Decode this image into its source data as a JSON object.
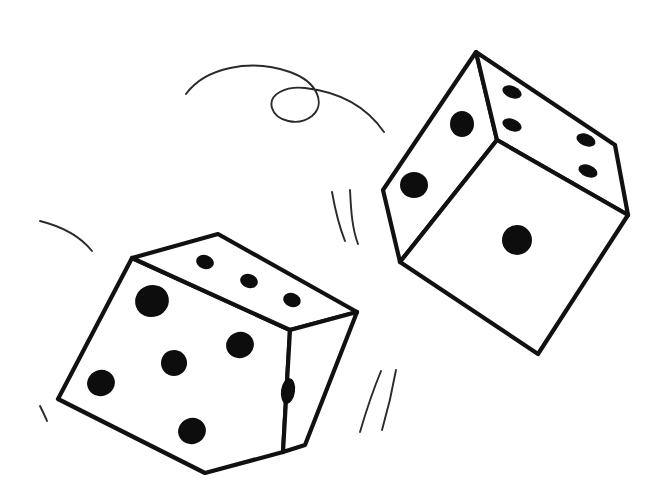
{
  "scene": {
    "title": "Two tumbling dice line drawing",
    "background_color": "#ffffff",
    "ink_color": "#111111",
    "pip_color": "#0d0d0d",
    "motion_line_color": "#2a2a2a",
    "width": 671,
    "height": 488
  },
  "dice": [
    {
      "name": "lower-left-die",
      "total_visible_pips": 9,
      "faces": [
        {
          "name": "front-left-face",
          "pip_count": 5,
          "outline": "132,258 58,399 205,473 283,452 290,330",
          "pips": [
            {
              "cx": 152,
              "cy": 301,
              "rx": 17,
              "ry": 16,
              "rot": -20
            },
            {
              "cx": 240,
              "cy": 345,
              "rx": 14,
              "ry": 13,
              "rot": -20
            },
            {
              "cx": 174,
              "cy": 363,
              "rx": 13,
              "ry": 13,
              "rot": -20
            },
            {
              "cx": 101,
              "cy": 383,
              "rx": 14,
              "ry": 13,
              "rot": -20
            },
            {
              "cx": 192,
              "cy": 431,
              "rx": 14,
              "ry": 13,
              "rot": -20
            }
          ]
        },
        {
          "name": "top-face",
          "pip_count": 3,
          "outline": "132,258 218,234 357,312 290,330",
          "pips": [
            {
              "cx": 205,
              "cy": 262,
              "rx": 9,
              "ry": 7,
              "rot": 20
            },
            {
              "cx": 249,
              "cy": 281,
              "rx": 9,
              "ry": 7,
              "rot": 20
            },
            {
              "cx": 292,
              "cy": 300,
              "rx": 9,
              "ry": 7,
              "rot": 20
            }
          ]
        },
        {
          "name": "right-face",
          "pip_count": 1,
          "outline": "290,330 357,312 305,445 283,452",
          "pips": [
            {
              "cx": 288,
              "cy": 391,
              "rx": 7,
              "ry": 13,
              "rot": 8
            }
          ]
        }
      ]
    },
    {
      "name": "upper-right-die",
      "total_visible_pips": 7,
      "faces": [
        {
          "name": "left-face",
          "pip_count": 2,
          "outline": "476,52 383,190 400,262 497,140",
          "pips": [
            {
              "cx": 462,
              "cy": 124,
              "rx": 12,
              "ry": 13,
              "rot": 0
            },
            {
              "cx": 414,
              "cy": 185,
              "rx": 14,
              "ry": 13,
              "rot": 0
            }
          ]
        },
        {
          "name": "right-top-face",
          "pip_count": 4,
          "outline": "476,52 615,145 628,215 497,140",
          "pips": [
            {
              "cx": 512,
              "cy": 92,
              "rx": 10,
              "ry": 6,
              "rot": 22
            },
            {
              "cx": 512,
              "cy": 125,
              "rx": 10,
              "ry": 6,
              "rot": 22
            },
            {
              "cx": 586,
              "cy": 140,
              "rx": 10,
              "ry": 6,
              "rot": 22
            },
            {
              "cx": 588,
              "cy": 171,
              "rx": 10,
              "ry": 6,
              "rot": 22
            }
          ]
        },
        {
          "name": "front-face",
          "pip_count": 1,
          "outline": "400,262 497,140 628,215 538,354",
          "pips": [
            {
              "cx": 517,
              "cy": 240,
              "rx": 15,
              "ry": 15,
              "rot": 0
            }
          ]
        }
      ]
    }
  ],
  "motion_marks": [
    {
      "name": "top-swirl-loop",
      "description": "long looping flourish above the dice",
      "path": "M 186 94 C 205 68 250 58 290 72 C 318 82 326 104 312 116 C 298 127 276 121 272 108 C 268 94 286 86 305 88 C 340 92 366 106 384 132"
    },
    {
      "name": "left-arc",
      "description": "short arc to the left of the lower die",
      "path": "M 40 221 C 60 226 80 236 92 251"
    },
    {
      "name": "left-tick",
      "description": "small tick below the left arc",
      "path": "M 40 406 C 43 412 45 416 47 421"
    },
    {
      "name": "mid-speed-line-1",
      "description": "curved speed line between the dice",
      "path": "M 332 192 C 335 209 339 226 345 241"
    },
    {
      "name": "mid-speed-line-2",
      "description": "second curved speed line between the dice",
      "path": "M 350 190 C 351 210 352 228 358 244"
    },
    {
      "name": "lower-speed-line-1",
      "description": "curved speed line below the lower die",
      "path": "M 360 432 C 367 408 374 388 381 371"
    },
    {
      "name": "lower-speed-line-2",
      "description": "second curved speed line below the lower die",
      "path": "M 382 430 C 389 406 393 387 396 370"
    }
  ]
}
